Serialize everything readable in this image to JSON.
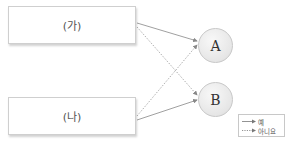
{
  "diagram": {
    "sources": [
      {
        "id": "ga",
        "label": "(가)"
      },
      {
        "id": "na",
        "label": "(나)"
      }
    ],
    "targets": [
      {
        "id": "A",
        "label": "A"
      },
      {
        "id": "B",
        "label": "B"
      }
    ],
    "edges": [
      {
        "from": "ga",
        "to": "A",
        "style": "solid",
        "meaning": "예"
      },
      {
        "from": "ga",
        "to": "B",
        "style": "dotted",
        "meaning": "아니요"
      },
      {
        "from": "na",
        "to": "A",
        "style": "dotted",
        "meaning": "아니요"
      },
      {
        "from": "na",
        "to": "B",
        "style": "solid",
        "meaning": "예"
      }
    ],
    "legend": {
      "solid_label": "예",
      "dotted_label": "아니요"
    },
    "colors": {
      "line": "#888888",
      "box_border": "#cfcfcf",
      "circle_fill": "#e6e6e6"
    }
  }
}
